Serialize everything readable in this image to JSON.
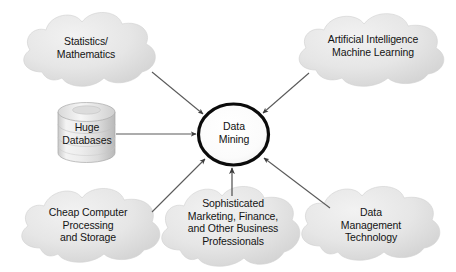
{
  "diagram": {
    "center": {
      "id": "data-mining",
      "label": "Data\nMining",
      "shape": "ellipse",
      "stroke": "#000000",
      "fill": "#ffffff"
    },
    "database": {
      "id": "huge-databases",
      "label": "Huge\nDatabases",
      "shape": "cylinder",
      "fill": "#e2e2e2",
      "stroke": "#9a9a9a"
    },
    "clouds": [
      {
        "id": "statistics-mathematics",
        "label": "Statistics/\nMathematics",
        "position": "top-left",
        "fill": "#e3e3e3"
      },
      {
        "id": "artificial-intelligence",
        "label": "Artificial Intelligence\nMachine Learning",
        "position": "top-right",
        "fill": "#e3e3e3"
      },
      {
        "id": "cheap-computer-processing",
        "label": "Cheap Computer\nProcessing\nand Storage",
        "position": "bottom-left",
        "fill": "#e3e3e3"
      },
      {
        "id": "sophisticated-professionals",
        "label": "Sophisticated\nMarketing, Finance,\nand Other Business\nProfessionals",
        "position": "bottom-center",
        "fill": "#e3e3e3"
      },
      {
        "id": "data-management-technology",
        "label": "Data\nManagement\nTechnology",
        "position": "bottom-right",
        "fill": "#e3e3e3"
      }
    ],
    "arrows": [
      {
        "id": "arrow-statistics-to-center",
        "from": "statistics-mathematics",
        "to": "data-mining",
        "style": "thin",
        "color": "#555555"
      },
      {
        "id": "arrow-ai-to-center",
        "from": "artificial-intelligence",
        "to": "data-mining",
        "style": "thin",
        "color": "#555555"
      },
      {
        "id": "arrow-databases-to-center",
        "from": "huge-databases",
        "to": "data-mining",
        "style": "thin",
        "color": "#555555"
      },
      {
        "id": "arrow-cheap-computer-to-center",
        "from": "cheap-computer-processing",
        "to": "data-mining",
        "style": "thin",
        "color": "#555555"
      },
      {
        "id": "arrow-professionals-to-center",
        "from": "sophisticated-professionals",
        "to": "data-mining",
        "style": "thin",
        "color": "#555555"
      },
      {
        "id": "arrow-data-management-to-center",
        "from": "data-management-technology",
        "to": "data-mining",
        "style": "thin",
        "color": "#555555"
      }
    ]
  }
}
